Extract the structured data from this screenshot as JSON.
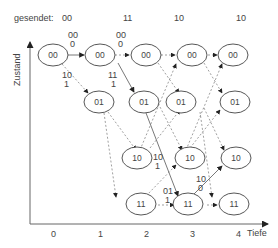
{
  "header": {
    "sent_label": "gesendet:",
    "sent_values": [
      {
        "text": "00",
        "x": 40
      },
      {
        "text": "11",
        "x": 128
      },
      {
        "text": "10",
        "x": 178
      },
      {
        "text": "10",
        "x": 240
      }
    ]
  },
  "axes": {
    "y_label": "Zustand",
    "x_label": "Tiefe",
    "x_ticks": [
      {
        "text": "0",
        "x": 53
      },
      {
        "text": "1",
        "x": 100
      },
      {
        "text": "2",
        "x": 146
      },
      {
        "text": "3",
        "x": 192
      },
      {
        "text": "4",
        "x": 233
      }
    ]
  },
  "nodes": [
    {
      "label": "00",
      "col": 0,
      "row": 0
    },
    {
      "label": "00",
      "col": 1,
      "row": 0
    },
    {
      "label": "00",
      "col": 2,
      "row": 0
    },
    {
      "label": "00",
      "col": 3,
      "row": 0
    },
    {
      "label": "00",
      "col": 4,
      "row": 0
    },
    {
      "label": "01",
      "col": 2,
      "row": 1
    },
    {
      "label": "01",
      "col": 3,
      "row": 1
    },
    {
      "label": "01",
      "col": 4,
      "row": 1
    },
    {
      "label": "01",
      "col": 5,
      "row": 1
    },
    {
      "label": "10",
      "col": 3,
      "row": 2
    },
    {
      "label": "10",
      "col": 4,
      "row": 2
    },
    {
      "label": "10",
      "col": 5,
      "row": 2
    },
    {
      "label": "11",
      "col": 3,
      "row": 3
    },
    {
      "label": "11",
      "col": 4,
      "row": 3
    },
    {
      "label": "11",
      "col": 5,
      "row": 3
    }
  ],
  "edge_labels": [
    {
      "lines": [
        "00",
        "0"
      ],
      "x": 73,
      "y": 33
    },
    {
      "lines": [
        "00",
        "0"
      ],
      "x": 119,
      "y": 33
    },
    {
      "lines": [
        "10",
        "1"
      ],
      "x": 65,
      "y": 77
    },
    {
      "lines": [
        "11",
        "1"
      ],
      "x": 111,
      "y": 77
    },
    {
      "lines": [
        "10",
        "1"
      ],
      "x": 155,
      "y": 160
    },
    {
      "lines": [
        "10",
        "0"
      ],
      "x": 199,
      "y": 178
    },
    {
      "lines": [
        "01",
        "1"
      ],
      "x": 166,
      "y": 192
    }
  ]
}
